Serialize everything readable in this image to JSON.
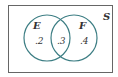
{
  "diagram": {
    "type": "venn",
    "universe_label": "S",
    "sets": [
      {
        "label": "E",
        "only_value": ".2"
      },
      {
        "label": "F",
        "only_value": ".4"
      }
    ],
    "intersection_value": ".3",
    "colors": {
      "circle_stroke": "#3d7e84",
      "frame_stroke": "#666666",
      "text": "#333333"
    }
  }
}
